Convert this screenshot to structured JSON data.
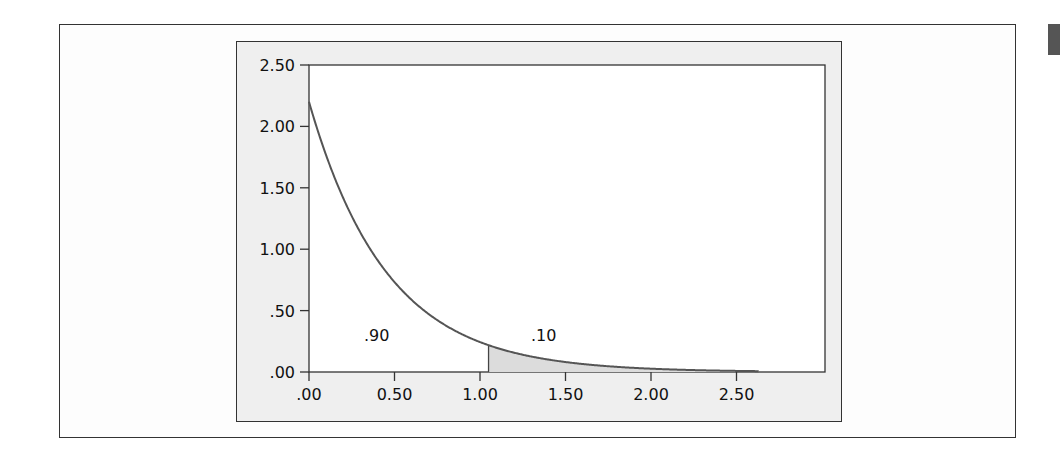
{
  "chart_data": {
    "type": "area",
    "title": "",
    "xlabel": "",
    "ylabel": "",
    "distribution": "exponential density",
    "rate_lambda": 2.2,
    "xlim": [
      0,
      3.0
    ],
    "ylim": [
      0,
      2.5
    ],
    "grid": false,
    "x_ticks": [
      ".00",
      "0.50",
      "1.00",
      "1.50",
      "2.00",
      "2.50"
    ],
    "x_tick_values": [
      0,
      0.5,
      1.0,
      1.5,
      2.0,
      2.5
    ],
    "y_ticks": [
      ".00",
      ".50",
      "1.00",
      "1.50",
      "2.00",
      "2.50"
    ],
    "y_tick_values": [
      0,
      0.5,
      1.0,
      1.5,
      2.0,
      2.5
    ],
    "curve": {
      "x": [
        0,
        0.25,
        0.5,
        0.75,
        1.0,
        1.05,
        1.25,
        1.5,
        1.75,
        2.0,
        2.25,
        2.5,
        2.63
      ],
      "y": [
        2.2,
        1.27,
        0.73,
        0.42,
        0.24,
        0.22,
        0.14,
        0.08,
        0.05,
        0.03,
        0.02,
        0.01,
        0.007
      ],
      "x_end": 2.63
    },
    "shaded_region": {
      "x_from": 1.05,
      "x_to": 2.63,
      "color": "#dcdcdc"
    },
    "annotations": [
      {
        "text": ".90",
        "x": 0.42,
        "y": 0.3,
        "meaning": "area left of cutoff"
      },
      {
        "text": ".10",
        "x": 1.42,
        "y": 0.3,
        "meaning": "shaded tail area"
      }
    ],
    "line_color": "#555555"
  },
  "labels": {
    "left_area": ".90",
    "right_area": ".10"
  }
}
